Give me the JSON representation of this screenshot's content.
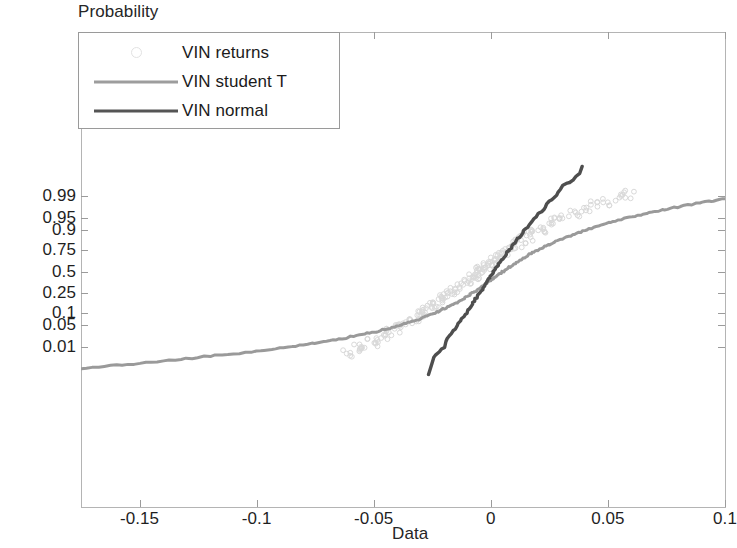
{
  "figure": {
    "ylabel": "Probability",
    "xlabel": "Data"
  },
  "legend": {
    "items": [
      {
        "label": "VIN returns",
        "style": "marker",
        "color": "#e2e2e2",
        "icon": "circle-marker-icon"
      },
      {
        "label": "VIN student T",
        "style": "line",
        "color": "#9d9d9d",
        "icon": "line-sample-icon"
      },
      {
        "label": "VIN normal",
        "style": "line",
        "color": "#555555",
        "icon": "line-sample-icon"
      }
    ]
  },
  "axes": {
    "x_ticks": [
      "-0.15",
      "-0.1",
      "-0.05",
      "0",
      "0.05",
      "0.1"
    ],
    "y_ticks": [
      "0.99",
      "0.95",
      "0.9",
      "0.75",
      "0.5",
      "0.25",
      "0.1",
      "0.05",
      "0.01"
    ]
  },
  "chart_data": {
    "type": "line",
    "title": "",
    "subtitle": "",
    "xlabel": "Data",
    "ylabel": "Probability",
    "plot_kind": "normal-probability-plot",
    "xlim": [
      -0.175,
      0.1
    ],
    "ylim_probability": [
      0.0008,
      0.9994
    ],
    "grid": false,
    "legend_position": "top-left",
    "x_ticks": [
      -0.15,
      -0.1,
      -0.05,
      0,
      0.05,
      0.1
    ],
    "y_ticks_probability": [
      0.99,
      0.95,
      0.9,
      0.75,
      0.5,
      0.25,
      0.1,
      0.05,
      0.01
    ],
    "series": [
      {
        "name": "VIN returns",
        "type": "scatter",
        "color": "#d9d9d9",
        "marker": "circle",
        "points": [
          [
            -0.061,
            0.006
          ],
          [
            -0.0565,
            0.0085
          ],
          [
            -0.054,
            0.011
          ],
          [
            -0.0505,
            0.015
          ],
          [
            -0.048,
            0.0195
          ],
          [
            -0.045,
            0.025
          ],
          [
            -0.0425,
            0.032
          ],
          [
            -0.04,
            0.04
          ],
          [
            -0.0375,
            0.0495
          ],
          [
            -0.035,
            0.061
          ],
          [
            -0.0325,
            0.074
          ],
          [
            -0.03,
            0.09
          ],
          [
            -0.028,
            0.107
          ],
          [
            -0.026,
            0.126
          ],
          [
            -0.024,
            0.148
          ],
          [
            -0.022,
            0.172
          ],
          [
            -0.02,
            0.199
          ],
          [
            -0.018,
            0.229
          ],
          [
            -0.016,
            0.262
          ],
          [
            -0.014,
            0.298
          ],
          [
            -0.012,
            0.337
          ],
          [
            -0.01,
            0.379
          ],
          [
            -0.0085,
            0.413
          ],
          [
            -0.007,
            0.448
          ],
          [
            -0.0055,
            0.483
          ],
          [
            -0.004,
            0.518
          ],
          [
            -0.0025,
            0.553
          ],
          [
            -0.001,
            0.587
          ],
          [
            0.0005,
            0.62
          ],
          [
            0.002,
            0.652
          ],
          [
            0.0035,
            0.683
          ],
          [
            0.005,
            0.711
          ],
          [
            0.007,
            0.746
          ],
          [
            0.009,
            0.778
          ],
          [
            0.011,
            0.806
          ],
          [
            0.0135,
            0.836
          ],
          [
            0.016,
            0.861
          ],
          [
            0.0185,
            0.883
          ],
          [
            0.0215,
            0.905
          ],
          [
            0.0245,
            0.923
          ],
          [
            0.028,
            0.939
          ],
          [
            0.0315,
            0.952
          ],
          [
            0.0355,
            0.963
          ],
          [
            0.04,
            0.972
          ],
          [
            0.0445,
            0.979
          ],
          [
            0.0495,
            0.9845
          ],
          [
            0.0545,
            0.9885
          ],
          [
            0.059,
            0.9915
          ]
        ]
      },
      {
        "name": "VIN student T",
        "type": "line",
        "color": "#9a9a9a",
        "linewidth": 3,
        "points": [
          [
            -0.175,
            0.0014
          ],
          [
            -0.16,
            0.0019
          ],
          [
            -0.145,
            0.0026
          ],
          [
            -0.13,
            0.0036
          ],
          [
            -0.115,
            0.005
          ],
          [
            -0.1,
            0.007
          ],
          [
            -0.09,
            0.009
          ],
          [
            -0.08,
            0.0118
          ],
          [
            -0.07,
            0.0158
          ],
          [
            -0.062,
            0.0203
          ],
          [
            -0.055,
            0.0258
          ],
          [
            -0.048,
            0.0335
          ],
          [
            -0.042,
            0.0425
          ],
          [
            -0.036,
            0.0555
          ],
          [
            -0.031,
            0.07
          ],
          [
            -0.0265,
            0.088
          ],
          [
            -0.0225,
            0.109
          ],
          [
            -0.019,
            0.132
          ],
          [
            -0.0155,
            0.161
          ],
          [
            -0.0125,
            0.192
          ],
          [
            -0.0095,
            0.229
          ],
          [
            -0.007,
            0.266
          ],
          [
            -0.0045,
            0.308
          ],
          [
            -0.002,
            0.353
          ],
          [
            0.0,
            0.392
          ],
          [
            0.0025,
            0.442
          ],
          [
            0.005,
            0.493
          ],
          [
            0.0075,
            0.543
          ],
          [
            0.01,
            0.591
          ],
          [
            0.013,
            0.644
          ],
          [
            0.016,
            0.691
          ],
          [
            0.0195,
            0.739
          ],
          [
            0.023,
            0.779
          ],
          [
            0.027,
            0.817
          ],
          [
            0.0315,
            0.851
          ],
          [
            0.0365,
            0.881
          ],
          [
            0.042,
            0.906
          ],
          [
            0.048,
            0.927
          ],
          [
            0.0545,
            0.944
          ],
          [
            0.0615,
            0.957
          ],
          [
            0.069,
            0.967
          ],
          [
            0.077,
            0.9745
          ],
          [
            0.0855,
            0.9805
          ],
          [
            0.093,
            0.9845
          ],
          [
            0.1,
            0.9875
          ]
        ]
      },
      {
        "name": "VIN normal",
        "type": "line",
        "color": "#4e4e4e",
        "linewidth": 3.4,
        "points": [
          [
            -0.0265,
            0.0008
          ],
          [
            -0.02,
            0.01
          ],
          [
            -0.015,
            0.038
          ],
          [
            -0.011,
            0.09
          ],
          [
            -0.0075,
            0.165
          ],
          [
            -0.0045,
            0.26
          ],
          [
            -0.002,
            0.36
          ],
          [
            0.0,
            0.448
          ],
          [
            0.0025,
            0.555
          ],
          [
            0.005,
            0.655
          ],
          [
            0.008,
            0.755
          ],
          [
            0.0115,
            0.845
          ],
          [
            0.0155,
            0.915
          ],
          [
            0.02,
            0.961
          ],
          [
            0.025,
            0.985
          ],
          [
            0.031,
            0.996
          ],
          [
            0.039,
            0.9994
          ]
        ]
      }
    ]
  }
}
